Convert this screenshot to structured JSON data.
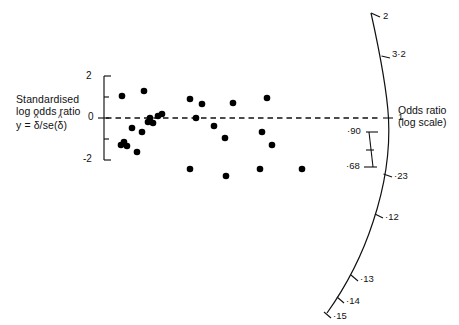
{
  "figure": {
    "type": "galbraith-radial-plot",
    "background": "#ffffff",
    "ink_color": "#000000"
  },
  "y_axis": {
    "caption_line1": "Standardised",
    "caption_line2": "log odds ratio",
    "caption_line3_prefix": "y =",
    "caption_line3_num": "δ",
    "caption_line3_mid": "/se(",
    "caption_line3_den": "δ",
    "caption_line3_suffix": ")",
    "ticks": [
      "2",
      "0",
      "-2"
    ],
    "tick_values": [
      2,
      0,
      -2
    ],
    "range": [
      -2,
      2
    ]
  },
  "right_axis": {
    "caption_line1": "Odds ratio",
    "caption_line2": "(log scale)",
    "tick_labels": [
      "2",
      "3·2",
      "1",
      "·90",
      "·68",
      "·23",
      "·12",
      "·13",
      "·14",
      "·15"
    ],
    "reference_label": "1"
  },
  "reference_line": {
    "value": 0,
    "style": "dashed"
  },
  "chart_data": {
    "type": "scatter",
    "title": "",
    "xlabel": "",
    "ylabel": "Standardised log odds ratio  y = δ/se(δ)",
    "ylim": [
      -2,
      2
    ],
    "grid": false,
    "legend": "none",
    "reference_line_y": 0,
    "right_axis_label": "Odds ratio (log scale)",
    "right_axis_ticks": [
      "2",
      "3·2",
      "1",
      "·90",
      "·68",
      "·23",
      "·12",
      "·13",
      "·14",
      "·15"
    ],
    "yticks": [
      2,
      0,
      -2
    ],
    "n_points": 26,
    "points": [
      {
        "px": 122,
        "py": 96
      },
      {
        "px": 144,
        "py": 91
      },
      {
        "px": 190,
        "py": 99
      },
      {
        "px": 202,
        "py": 104
      },
      {
        "px": 233,
        "py": 103
      },
      {
        "px": 267,
        "py": 98
      },
      {
        "px": 158,
        "py": 116
      },
      {
        "px": 162,
        "py": 114
      },
      {
        "px": 148,
        "py": 122
      },
      {
        "px": 150,
        "py": 118
      },
      {
        "px": 153,
        "py": 123
      },
      {
        "px": 196,
        "py": 118
      },
      {
        "px": 132,
        "py": 128
      },
      {
        "px": 142,
        "py": 132
      },
      {
        "px": 262,
        "py": 132
      },
      {
        "px": 121,
        "py": 145
      },
      {
        "px": 124,
        "py": 142
      },
      {
        "px": 127,
        "py": 146
      },
      {
        "px": 137,
        "py": 152
      },
      {
        "px": 214,
        "py": 126
      },
      {
        "px": 225,
        "py": 138
      },
      {
        "px": 272,
        "py": 145
      },
      {
        "px": 190,
        "py": 169
      },
      {
        "px": 226,
        "py": 176
      },
      {
        "px": 260,
        "py": 169
      },
      {
        "px": 302,
        "py": 169
      }
    ],
    "marker": {
      "shape": "circle",
      "size": 4.2,
      "color": "#000000"
    }
  }
}
